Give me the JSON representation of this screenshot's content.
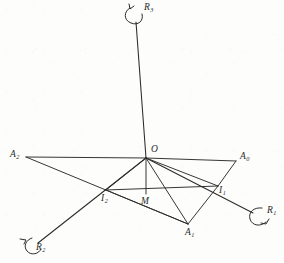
{
  "figure": {
    "background_color": "#fdfdfb",
    "ink_color": "#2b2b2b",
    "width": 284,
    "height": 263
  },
  "labels": {
    "axis_r3": {
      "text": "R",
      "sub": "3"
    },
    "axis_r1": {
      "text": "R",
      "sub": "1"
    },
    "axis_r2": {
      "text": "R",
      "sub": "2"
    },
    "origin": {
      "text": "O",
      "sub": ""
    },
    "point_a0": {
      "text": "A",
      "sub": "0"
    },
    "point_a1": {
      "text": "A",
      "sub": "1"
    },
    "point_a2": {
      "text": "A",
      "sub": "2"
    },
    "point_i1": {
      "text": "I",
      "sub": "1"
    },
    "point_i2": {
      "text": "I",
      "sub": "2"
    },
    "point_m": {
      "text": "M",
      "sub": ""
    }
  },
  "geometry": {
    "points": {
      "O": [
        146,
        158
      ],
      "A0": [
        236,
        161
      ],
      "A1": [
        188,
        224
      ],
      "A2": [
        26,
        157
      ],
      "I1": [
        218,
        186
      ],
      "I2": [
        106,
        190
      ],
      "M": [
        146,
        194
      ],
      "R3_tip": [
        136,
        22
      ],
      "R1_tip": [
        253,
        213
      ],
      "R2_tip": [
        38,
        243
      ]
    },
    "segments": [
      [
        "R3_tip",
        "O"
      ],
      [
        "O",
        "R1_tip"
      ],
      [
        "O",
        "R2_tip"
      ],
      [
        "O",
        "A2"
      ],
      [
        "O",
        "A0"
      ],
      [
        "O",
        "A1"
      ],
      [
        "O",
        "M"
      ],
      [
        "O",
        "I1"
      ],
      [
        "O",
        "I2"
      ],
      [
        "A2",
        "A1"
      ],
      [
        "A0",
        "I1"
      ],
      [
        "A1",
        "I1"
      ],
      [
        "I2",
        "I1"
      ],
      [
        "I2",
        "A1"
      ]
    ]
  }
}
